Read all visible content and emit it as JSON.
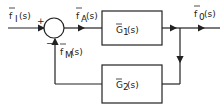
{
  "diagram": {
    "type": "block-diagram-feedback-loop",
    "input_signal": {
      "label": "f",
      "sub": "I",
      "arg": "(s)"
    },
    "error_signal": {
      "label": "f",
      "sub": "A",
      "arg": "(s)"
    },
    "feedback_signal": {
      "label": "f",
      "sub": "M",
      "arg": "(s)"
    },
    "output_signal": {
      "label": "f",
      "sub": "0",
      "arg": "(s)"
    },
    "summing_junction": {
      "plus_sign": "+",
      "minus_sign": "−"
    },
    "forward_block": {
      "label": "G",
      "sub": "1",
      "arg": "(s)"
    },
    "feedback_block": {
      "label": "G",
      "sub": "2",
      "arg": "(s)"
    },
    "colors": {
      "line": "#222222",
      "background": "#ffffff"
    }
  }
}
